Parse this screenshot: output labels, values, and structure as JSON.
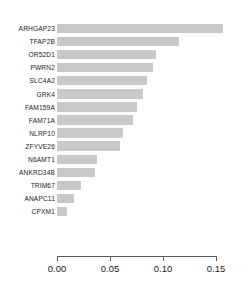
{
  "chart_data": {
    "type": "bar",
    "orientation": "horizontal",
    "title": "",
    "subtitle": "",
    "xlabel": "",
    "ylabel": "",
    "categories": [
      "ARHGAP23",
      "TFAP2B",
      "OR52D1",
      "PWRN2",
      "SLC4A2",
      "GRK4",
      "FAM159A",
      "FAM71A",
      "NLRP10",
      "ZFYVE26",
      "N6AMT1",
      "ANKRD34B",
      "TRIM67",
      "ANAPC11",
      "CPXM1"
    ],
    "values": [
      0.157,
      0.115,
      0.093,
      0.091,
      0.085,
      0.081,
      0.075,
      0.072,
      0.062,
      0.059,
      0.038,
      0.036,
      0.023,
      0.016,
      0.009
    ],
    "xlim": [
      0.0,
      0.16
    ],
    "xticks": [
      0.0,
      0.05,
      0.1,
      0.15
    ],
    "xticklabels": [
      "0.00",
      "0.05",
      "0.10",
      "0.15"
    ],
    "grid": false,
    "legend": null,
    "bar_color": "#c9c9c9",
    "axis_color": "#595959",
    "text_color": "#1a1a1a",
    "background": "#ffffff"
  }
}
